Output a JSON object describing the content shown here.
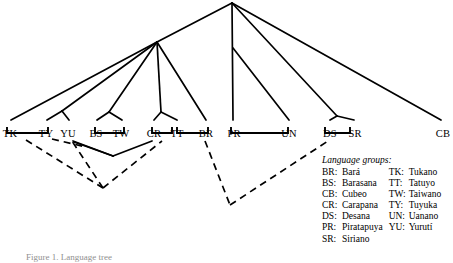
{
  "figure": {
    "type": "phylogenetic-tree",
    "caption": "Figure 1. Language tree",
    "line_color": "#000000",
    "background_color": "#ffffff"
  },
  "leaves": [
    {
      "code": "TK",
      "x": 10,
      "y": 128
    },
    {
      "code": "TY",
      "x": 46,
      "y": 128
    },
    {
      "code": "YU",
      "x": 68,
      "y": 128
    },
    {
      "code": "BS",
      "x": 96,
      "y": 128
    },
    {
      "code": "TW",
      "x": 121,
      "y": 128
    },
    {
      "code": "CR",
      "x": 154,
      "y": 128
    },
    {
      "code": "TT",
      "x": 177,
      "y": 128
    },
    {
      "code": "BR",
      "x": 206,
      "y": 128
    },
    {
      "code": "PR",
      "x": 234,
      "y": 128
    },
    {
      "code": "UN",
      "x": 289,
      "y": 128
    },
    {
      "code": "DS",
      "x": 330,
      "y": 128
    },
    {
      "code": "SR",
      "x": 355,
      "y": 128
    },
    {
      "code": "CB",
      "x": 443,
      "y": 128
    }
  ],
  "legend": {
    "title": "Language groups:",
    "left_column": [
      {
        "code": "BR:",
        "name": "Bará"
      },
      {
        "code": "BS:",
        "name": "Barasana"
      },
      {
        "code": "CB:",
        "name": "Cubeo"
      },
      {
        "code": "CR:",
        "name": "Carapana"
      },
      {
        "code": "DS:",
        "name": "Desana"
      },
      {
        "code": "PR:",
        "name": "Piratapuya"
      },
      {
        "code": "SR:",
        "name": "Siriano"
      }
    ],
    "right_column": [
      {
        "code": "TK:",
        "name": "Tukano"
      },
      {
        "code": "TT:",
        "name": "Tatuyo"
      },
      {
        "code": "TW:",
        "name": "Taiwano"
      },
      {
        "code": "TY:",
        "name": "Tuyuka"
      },
      {
        "code": "UN:",
        "name": "Uanano"
      },
      {
        "code": "YU:",
        "name": "Yurutí"
      }
    ]
  },
  "tree_edges": {
    "solid": [
      {
        "name": "apex-to-left-node",
        "x1": 232,
        "y1": 3,
        "x2": 157,
        "y2": 42
      },
      {
        "name": "apex-to-pr",
        "x1": 232,
        "y1": 3,
        "x2": 233,
        "y2": 120
      },
      {
        "name": "apex-to-un",
        "x1": 233,
        "y1": 48,
        "x2": 289,
        "y2": 120
      },
      {
        "name": "apex-to-ds-sr-node",
        "x1": 232,
        "y1": 3,
        "x2": 337,
        "y2": 116
      },
      {
        "name": "apex-to-cb",
        "x1": 232,
        "y1": 3,
        "x2": 441,
        "y2": 120
      },
      {
        "name": "left-node-to-tk",
        "x1": 157,
        "y1": 42,
        "x2": 11,
        "y2": 120
      },
      {
        "name": "left-node-to-ty-fork",
        "x1": 157,
        "y1": 42,
        "x2": 62,
        "y2": 111
      },
      {
        "name": "ty-fork-to-ty",
        "x1": 62,
        "y1": 111,
        "x2": 47,
        "y2": 120
      },
      {
        "name": "ty-fork-to-yu",
        "x1": 62,
        "y1": 111,
        "x2": 69,
        "y2": 120
      },
      {
        "name": "left-node-to-bs-node",
        "x1": 157,
        "y1": 42,
        "x2": 109,
        "y2": 112
      },
      {
        "name": "bs-node-to-bs",
        "x1": 109,
        "y1": 112,
        "x2": 97,
        "y2": 120
      },
      {
        "name": "bs-node-to-tw",
        "x1": 109,
        "y1": 112,
        "x2": 122,
        "y2": 120
      },
      {
        "name": "left-node-to-cr-node",
        "x1": 157,
        "y1": 42,
        "x2": 161,
        "y2": 112
      },
      {
        "name": "cr-node-to-cr",
        "x1": 161,
        "y1": 112,
        "x2": 154,
        "y2": 120
      },
      {
        "name": "cr-node-to-tt",
        "x1": 161,
        "y1": 112,
        "x2": 177,
        "y2": 120
      },
      {
        "name": "left-node-to-br",
        "x1": 157,
        "y1": 42,
        "x2": 206,
        "y2": 120
      },
      {
        "name": "ds-node-to-ds",
        "x1": 337,
        "y1": 116,
        "x2": 330,
        "y2": 120
      },
      {
        "name": "ds-node-to-sr",
        "x1": 337,
        "y1": 116,
        "x2": 354,
        "y2": 120
      }
    ],
    "brackets": [
      {
        "name": "bracket-tk-ty",
        "x1": 7,
        "x2": 48,
        "y": 133,
        "depth": 6
      },
      {
        "name": "bracket-bs-tw",
        "x1": 95,
        "x2": 124,
        "y": 133,
        "depth": 6
      },
      {
        "name": "bracket-cr-tt",
        "x1": 152,
        "x2": 172,
        "y": 133,
        "depth": 6
      },
      {
        "name": "bracket-tt-br",
        "x1": 177,
        "x2": 208,
        "y": 133,
        "depth": 6
      },
      {
        "name": "bracket-pr-un",
        "x1": 231,
        "x2": 288,
        "y": 133,
        "depth": 6
      },
      {
        "name": "bracket-ds-sr",
        "x1": 325,
        "x2": 350,
        "y": 133,
        "depth": 6
      }
    ],
    "solid_links": [
      {
        "name": "link-tk-ty-to-vertex",
        "x1": 73,
        "y1": 141,
        "x2": 113,
        "y2": 156
      },
      {
        "name": "link-vertex-to-bs-tw",
        "x1": 113,
        "y1": 156,
        "x2": 152,
        "y2": 141
      },
      {
        "name": "link-vertex-to-cr-tt",
        "x1": 113,
        "y1": 156,
        "x2": 74,
        "y2": 142
      }
    ],
    "dashed": [
      {
        "name": "dashed-tk-to-v1",
        "x1": 26,
        "y1": 140,
        "x2": 103,
        "y2": 188
      },
      {
        "name": "dashed-v1-to-yu",
        "x1": 103,
        "y1": 188,
        "x2": 70,
        "y2": 138
      },
      {
        "name": "dashed-v1-to-cr",
        "x1": 103,
        "y1": 188,
        "x2": 162,
        "y2": 141
      },
      {
        "name": "dashed-ty-cross",
        "x1": 52,
        "y1": 139,
        "x2": 86,
        "y2": 147
      },
      {
        "name": "dashed-br-to-v2",
        "x1": 205,
        "y1": 141,
        "x2": 230,
        "y2": 205
      },
      {
        "name": "dashed-v2-to-ds",
        "x1": 230,
        "y1": 205,
        "x2": 328,
        "y2": 141
      }
    ]
  }
}
